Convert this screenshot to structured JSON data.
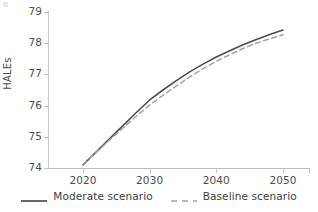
{
  "chart_data": {
    "type": "line",
    "title": "",
    "xlabel": "",
    "ylabel": "HALEs",
    "xlim": [
      2018,
      2052
    ],
    "ylim": [
      74,
      79
    ],
    "grid": false,
    "legend_position": "bottom",
    "x_ticks": [
      "2020",
      "2030",
      "2040",
      "2050"
    ],
    "x_tick_values": [
      2020,
      2030,
      2040,
      2050
    ],
    "y_ticks": [
      "74",
      "75",
      "76",
      "77",
      "78",
      "79"
    ],
    "y_tick_values": [
      74,
      75,
      76,
      77,
      78,
      79
    ],
    "x": [
      2020,
      2022,
      2024,
      2026,
      2028,
      2030,
      2032,
      2034,
      2036,
      2038,
      2040,
      2042,
      2044,
      2046,
      2048,
      2050
    ],
    "series": [
      {
        "name": "Moderate scenario",
        "style": "solid",
        "color": "#4d4d4d",
        "values": [
          74.1,
          74.52,
          74.94,
          75.36,
          75.78,
          76.18,
          76.5,
          76.8,
          77.08,
          77.33,
          77.56,
          77.76,
          77.95,
          78.12,
          78.28,
          78.42
        ]
      },
      {
        "name": "Baseline scenario",
        "style": "dashed",
        "color": "#a3a3a3",
        "values": [
          74.1,
          74.5,
          74.9,
          75.28,
          75.66,
          76.02,
          76.33,
          76.63,
          76.92,
          77.18,
          77.42,
          77.63,
          77.83,
          78.0,
          78.14,
          78.27
        ]
      }
    ]
  },
  "legend": {
    "entries": [
      {
        "label": "Moderate scenario",
        "style": "solid",
        "color": "#4d4d4d"
      },
      {
        "label": "Baseline scenario",
        "style": "dashed",
        "color": "#a3a3a3"
      }
    ]
  },
  "colors": {
    "moderate": "#4d4d4d",
    "baseline": "#a3a3a3",
    "axis": "#c2c2c2",
    "text": "#3d3d3d",
    "background": "#ffffff"
  }
}
